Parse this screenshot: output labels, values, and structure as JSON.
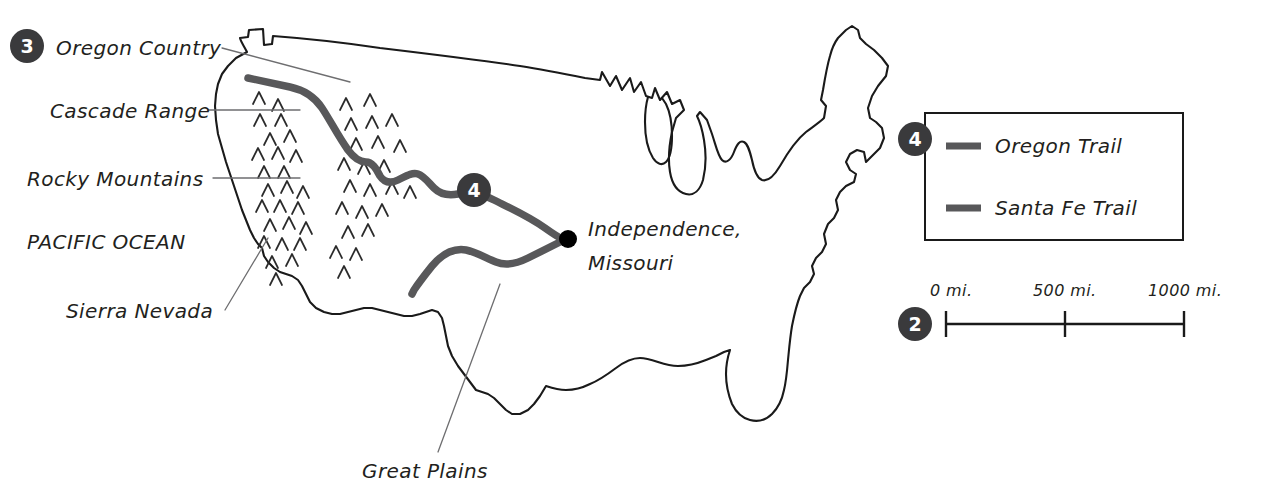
{
  "map": {
    "title": "Oregon Trail and Santa Fe Trail Map",
    "ocean_label": "PACIFIC OCEAN",
    "labels": [
      {
        "id": "oregon-country",
        "text": "Oregon Country"
      },
      {
        "id": "cascade-range",
        "text": "Cascade Range"
      },
      {
        "id": "rocky-mountains",
        "text": "Rocky Mountains"
      },
      {
        "id": "sierra-nevada",
        "text": "Sierra Nevada"
      },
      {
        "id": "great-plains",
        "text": "Great Plains"
      }
    ],
    "city": {
      "name_line1": "Independence,",
      "name_line2": "Missouri"
    },
    "badges": {
      "oregon_country": "3",
      "trail_marker": "4",
      "legend": "4",
      "scale": "2"
    }
  },
  "legend": {
    "items": [
      {
        "label": "Oregon Trail",
        "color": "#58585a"
      },
      {
        "label": "Santa Fe Trail",
        "color": "#58585a"
      }
    ]
  },
  "scale_bar": {
    "ticks": [
      "0 mi.",
      "500 mi.",
      "1000 mi."
    ]
  },
  "colors": {
    "ink": "#1a1a1a",
    "trail": "#58585a",
    "badge": "#3a3a3c",
    "leader": "#6e6e70",
    "background": "#ffffff"
  }
}
